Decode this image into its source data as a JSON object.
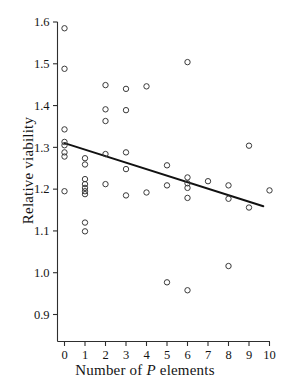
{
  "chart_data": {
    "type": "scatter",
    "title": "",
    "xlabel": "Number of P elements",
    "xlabel_plain": "Number of ",
    "xlabel_italic": "P",
    "xlabel_tail": " elements",
    "ylabel": "Relative viability",
    "xlim": [
      -0.45,
      10.45
    ],
    "ylim": [
      0.855,
      1.635
    ],
    "xticks": [
      0,
      1,
      2,
      3,
      4,
      5,
      6,
      7,
      8,
      9,
      10
    ],
    "xtick_labels": [
      "0",
      "1",
      "2",
      "3",
      "4",
      "5",
      "6",
      "7",
      "8",
      "9",
      "10"
    ],
    "yticks": [
      0.9,
      1.0,
      1.1,
      1.2,
      1.3,
      1.4,
      1.5,
      1.6
    ],
    "ytick_labels": [
      "0.9",
      "1.0",
      "1.1",
      "1.2",
      "1.3",
      "1.4",
      "1.5",
      "1.6"
    ],
    "grid": false,
    "legend": "none",
    "marker": "open-circle",
    "marker_color": "#3a3a3a",
    "line_color": "#111111",
    "points": [
      {
        "x": 0,
        "y": 1.585
      },
      {
        "x": 0,
        "y": 1.488
      },
      {
        "x": 0,
        "y": 1.343
      },
      {
        "x": 0,
        "y": 1.313
      },
      {
        "x": 0,
        "y": 1.305
      },
      {
        "x": 0,
        "y": 1.288
      },
      {
        "x": 0,
        "y": 1.278
      },
      {
        "x": 0,
        "y": 1.195
      },
      {
        "x": 1,
        "y": 1.274
      },
      {
        "x": 1,
        "y": 1.259
      },
      {
        "x": 1,
        "y": 1.224
      },
      {
        "x": 1,
        "y": 1.212
      },
      {
        "x": 1,
        "y": 1.203
      },
      {
        "x": 1,
        "y": 1.195
      },
      {
        "x": 1,
        "y": 1.188
      },
      {
        "x": 1,
        "y": 1.12
      },
      {
        "x": 1,
        "y": 1.099
      },
      {
        "x": 2,
        "y": 1.449
      },
      {
        "x": 2,
        "y": 1.391
      },
      {
        "x": 2,
        "y": 1.363
      },
      {
        "x": 2,
        "y": 1.284
      },
      {
        "x": 2,
        "y": 1.212
      },
      {
        "x": 3,
        "y": 1.44
      },
      {
        "x": 3,
        "y": 1.389
      },
      {
        "x": 3,
        "y": 1.288
      },
      {
        "x": 3,
        "y": 1.248
      },
      {
        "x": 3,
        "y": 1.185
      },
      {
        "x": 4,
        "y": 1.446
      },
      {
        "x": 4,
        "y": 1.192
      },
      {
        "x": 5,
        "y": 1.257
      },
      {
        "x": 5,
        "y": 1.209
      },
      {
        "x": 5,
        "y": 0.977
      },
      {
        "x": 6,
        "y": 1.504
      },
      {
        "x": 6,
        "y": 1.228
      },
      {
        "x": 6,
        "y": 1.214
      },
      {
        "x": 6,
        "y": 1.203
      },
      {
        "x": 6,
        "y": 1.179
      },
      {
        "x": 6,
        "y": 0.958
      },
      {
        "x": 7,
        "y": 1.219
      },
      {
        "x": 8,
        "y": 1.209
      },
      {
        "x": 8,
        "y": 1.177
      },
      {
        "x": 8,
        "y": 1.016
      },
      {
        "x": 9,
        "y": 1.304
      },
      {
        "x": 9,
        "y": 1.156
      },
      {
        "x": 10,
        "y": 1.197
      }
    ],
    "regression_line": {
      "x_start": 0.0,
      "y_start": 1.31,
      "x_end": 9.7,
      "y_end": 1.159
    }
  }
}
